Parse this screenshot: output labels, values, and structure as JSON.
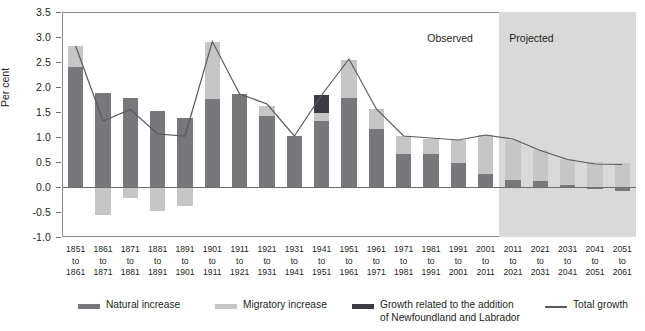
{
  "chart_data": {
    "type": "bar",
    "title": "",
    "xlabel": "",
    "ylabel": "Per cent",
    "ylim": [
      -1.0,
      3.5
    ],
    "ytick_labels": [
      "3.5",
      "3.0",
      "2.5",
      "2.0",
      "1.5",
      "1.0",
      "0.5",
      "0.0",
      "-0.5",
      "-1.0"
    ],
    "ytick_values": [
      3.5,
      3.0,
      2.5,
      2.0,
      1.5,
      1.0,
      0.5,
      0.0,
      -0.5,
      -1.0
    ],
    "grid": false,
    "legend_position": "bottom",
    "stacked": true,
    "categories": [
      "1851 to 1861",
      "1861 to 1871",
      "1871 to 1881",
      "1881 to 1891",
      "1891 to 1901",
      "1901 to 1911",
      "1911 to 1921",
      "1921 to 1931",
      "1931 to 1941",
      "1941 to 1951",
      "1951 to 1961",
      "1961 to 1971",
      "1971 to 1981",
      "1981 to 1991",
      "1991 to 2001",
      "2001 to 2011",
      "2011 to 2021",
      "2021 to 2031",
      "2031 to 2041",
      "2041 to 2051",
      "2051 to 2061"
    ],
    "category_lines": [
      [
        "1851",
        "to",
        "1861"
      ],
      [
        "1861",
        "to",
        "1871"
      ],
      [
        "1871",
        "to",
        "1881"
      ],
      [
        "1881",
        "to",
        "1891"
      ],
      [
        "1891",
        "to",
        "1901"
      ],
      [
        "1901",
        "to",
        "1911"
      ],
      [
        "1911",
        "to",
        "1921"
      ],
      [
        "1921",
        "to",
        "1931"
      ],
      [
        "1931",
        "to",
        "1941"
      ],
      [
        "1941",
        "to",
        "1951"
      ],
      [
        "1951",
        "to",
        "1961"
      ],
      [
        "1961",
        "to",
        "1971"
      ],
      [
        "1971",
        "to",
        "1981"
      ],
      [
        "1981",
        "to",
        "1991"
      ],
      [
        "1991",
        "to",
        "2001"
      ],
      [
        "2001",
        "to",
        "2011"
      ],
      [
        "2011",
        "to",
        "2021"
      ],
      [
        "2021",
        "to",
        "2031"
      ],
      [
        "2031",
        "to",
        "2041"
      ],
      [
        "2041",
        "to",
        "2051"
      ],
      [
        "2051",
        "to",
        "2061"
      ]
    ],
    "series": [
      {
        "name": "Natural increase",
        "color": "#78787c",
        "values": [
          2.4,
          1.88,
          1.79,
          1.53,
          1.38,
          1.77,
          1.87,
          1.43,
          1.02,
          1.32,
          1.78,
          1.16,
          0.67,
          0.67,
          0.49,
          0.27,
          0.15,
          0.12,
          0.05,
          -0.04,
          -0.08
        ]
      },
      {
        "name": "Migratory increase",
        "color": "#c6c6c6",
        "values": [
          0.42,
          -0.55,
          -0.22,
          -0.47,
          -0.37,
          1.14,
          0.0,
          0.2,
          0.0,
          0.16,
          0.77,
          0.4,
          0.35,
          0.3,
          0.45,
          0.77,
          0.8,
          0.62,
          0.52,
          0.5,
          0.49
        ]
      },
      {
        "name": "Growth related to the addition of Newfoundland and Labrador",
        "color": "#3b3b44",
        "values": [
          0,
          0,
          0,
          0,
          0,
          0,
          0,
          0,
          0,
          0.36,
          0,
          0,
          0,
          0,
          0,
          0,
          0,
          0,
          0,
          0,
          0
        ]
      }
    ],
    "line_series": {
      "name": "Total growth",
      "color": "#5a5a5a",
      "values": [
        2.82,
        1.32,
        1.55,
        1.06,
        1.02,
        2.91,
        1.86,
        1.66,
        1.02,
        1.84,
        2.56,
        1.56,
        1.02,
        0.98,
        0.94,
        1.04,
        0.96,
        0.73,
        0.55,
        0.46,
        0.45
      ]
    },
    "annotations": [
      {
        "label": "Observed",
        "x_fraction": 0.68
      },
      {
        "label": "Projected",
        "x_fraction": 0.8
      }
    ],
    "regions": [
      {
        "label": "Projected",
        "start_category_index": 16,
        "color": "#d9d9d9"
      }
    ]
  },
  "legend": {
    "items": [
      {
        "label": "Natural increase",
        "swatch": "bar",
        "color": "#78787c"
      },
      {
        "label": "Migratory increase",
        "swatch": "bar",
        "color": "#c6c6c6"
      },
      {
        "label_line1": "Growth related to the addition",
        "label_line2": "of Newfoundland and Labrador",
        "swatch": "bar",
        "color": "#3b3b44"
      },
      {
        "label": "Total growth",
        "swatch": "line",
        "color": "#5a5a5a"
      }
    ]
  }
}
